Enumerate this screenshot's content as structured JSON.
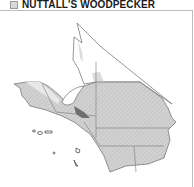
{
  "header": {
    "title": "NUTTALL'S WOODPECKER",
    "legend_icon": "range-swatch-icon"
  },
  "map": {
    "region": "Southern California",
    "fill_colors": {
      "range": "#cfcfcf",
      "range_hatch": "#b5b5b5",
      "dense": "#777777",
      "light": "#e6e6e6",
      "outline": "#6a6a6a",
      "background": "#ffffff"
    },
    "features": [
      "county-boundaries",
      "channel-islands",
      "high-density-patch"
    ]
  }
}
